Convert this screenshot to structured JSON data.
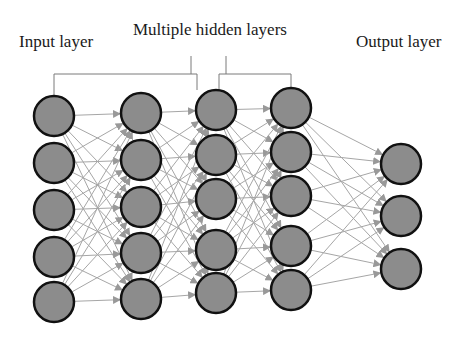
{
  "labels": {
    "input": "Input layer",
    "hidden": "Multiple hidden layers",
    "output": "Output layer"
  },
  "colors": {
    "node_fill": "#8c8c8c",
    "node_stroke": "#111111",
    "edge": "#a6a6a6",
    "arrow": "#999999",
    "bracket": "#7a7a7a",
    "text": "#1a1a1a"
  },
  "layers": [
    {
      "name": "input",
      "x": 54,
      "nodes_y": [
        116,
        163,
        210,
        257,
        302
      ]
    },
    {
      "name": "hidden-1",
      "x": 141,
      "nodes_y": [
        113,
        160,
        207,
        253,
        299
      ]
    },
    {
      "name": "hidden-2",
      "x": 216,
      "nodes_y": [
        110,
        155,
        199,
        250,
        293
      ]
    },
    {
      "name": "hidden-3",
      "x": 291,
      "nodes_y": [
        108,
        152,
        196,
        246,
        290
      ]
    },
    {
      "name": "output",
      "x": 401,
      "nodes_y": [
        164,
        216,
        269
      ]
    }
  ],
  "node_radius": 20
}
